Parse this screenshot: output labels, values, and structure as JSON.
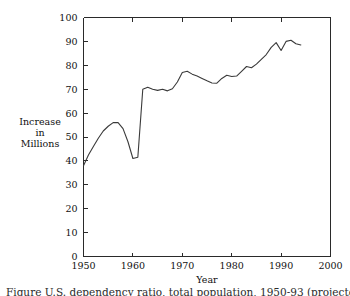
{
  "figure": {
    "caption": "Figure  U.S. dependency ratio, total population, 1950-93 (projected)",
    "background_color": "#ffffff",
    "line_color": "#3a3a3a",
    "axis_color": "#2a2a2a"
  },
  "chart_data": {
    "type": "line",
    "title": "",
    "xlabel": "Year",
    "ylabel": "Increase in Millions",
    "ylabel_lines": [
      "Increase",
      "in",
      "Millions"
    ],
    "xlim": [
      1950,
      2000
    ],
    "ylim": [
      0,
      100
    ],
    "xticks": [
      1950,
      1960,
      1970,
      1980,
      1990,
      2000
    ],
    "yticks": [
      0,
      10,
      20,
      30,
      40,
      50,
      60,
      70,
      80,
      90,
      100
    ],
    "xtick_labels": [
      "1950",
      "1960",
      "1970",
      "1980",
      "1990",
      "2000"
    ],
    "ytick_labels": [
      "0",
      "10",
      "20",
      "30",
      "40",
      "50",
      "60",
      "70",
      "80",
      "90",
      "100"
    ],
    "grid": false,
    "legend": null,
    "x": [
      1950,
      1951,
      1952,
      1953,
      1954,
      1955,
      1956,
      1957,
      1958,
      1959,
      1960,
      1961,
      1962,
      1963,
      1964,
      1965,
      1966,
      1967,
      1968,
      1969,
      1970,
      1971,
      1972,
      1973,
      1974,
      1975,
      1976,
      1977,
      1978,
      1979,
      1980,
      1981,
      1982,
      1983,
      1984,
      1985,
      1986,
      1987,
      1988,
      1989,
      1990,
      1991,
      1992,
      1993,
      1994
    ],
    "values": [
      38.0,
      42.5,
      46.0,
      49.5,
      52.5,
      54.5,
      56.0,
      56.0,
      53.5,
      48.0,
      41.0,
      41.5,
      70.0,
      70.8,
      70.0,
      69.5,
      70.0,
      69.3,
      70.2,
      73.0,
      77.0,
      77.5,
      76.3,
      75.5,
      74.5,
      73.5,
      72.6,
      72.5,
      74.5,
      75.8,
      75.3,
      75.5,
      77.5,
      79.5,
      79.0,
      80.5,
      82.5,
      84.5,
      87.5,
      89.5,
      86.2,
      90.0,
      90.5,
      89.0,
      88.5
    ],
    "series_name": "Increase in Millions"
  }
}
